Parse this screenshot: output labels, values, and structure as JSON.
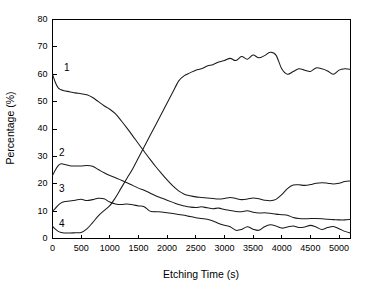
{
  "chart_data": {
    "type": "line",
    "title": "",
    "xlabel": "Etching Time (s)",
    "ylabel": "Percentage (%)",
    "xlim": [
      0,
      5200
    ],
    "ylim": [
      0,
      80
    ],
    "xticks": [
      0,
      500,
      1000,
      1500,
      2000,
      2500,
      3000,
      3500,
      4000,
      4500,
      5000
    ],
    "yticks": [
      0,
      10,
      20,
      30,
      40,
      50,
      60,
      70,
      80
    ],
    "xtick_labels": [
      "0",
      "500",
      "1000",
      "1500",
      "2000",
      "2500",
      "3000",
      "3500",
      "4000",
      "4500",
      "5000"
    ],
    "ytick_labels": [
      "0",
      "10",
      "20",
      "30",
      "40",
      "50",
      "60",
      "70",
      "80"
    ],
    "grid": false,
    "legend": "inline-curve-labels",
    "series": [
      {
        "name": "1",
        "label": "1",
        "label_x": 250,
        "label_y": 62,
        "x": [
          0,
          50,
          100,
          150,
          200,
          300,
          400,
          500,
          600,
          700,
          800,
          900,
          1000,
          1100,
          1200,
          1300,
          1400,
          1500,
          1600,
          1700,
          1800,
          1900,
          2000,
          2100,
          2200,
          2300,
          2400,
          2500,
          2600,
          2700,
          2800,
          2900,
          3000,
          3100,
          3200,
          3300,
          3400,
          3500,
          3600,
          3700,
          3800,
          3900,
          4000,
          4100,
          4200,
          4300,
          4400,
          4500,
          4600,
          4700,
          4800,
          4900,
          5000,
          5100,
          5200
        ],
        "y": [
          60.0,
          57.0,
          55.0,
          54.3,
          54.0,
          53.6,
          53.2,
          52.9,
          52.5,
          51.5,
          50.0,
          48.5,
          47.2,
          45.5,
          43.0,
          40.3,
          37.5,
          34.6,
          31.8,
          29.0,
          26.3,
          23.8,
          21.4,
          19.2,
          17.4,
          16.2,
          15.6,
          15.2,
          15.0,
          14.8,
          14.6,
          14.4,
          14.6,
          15.0,
          14.6,
          14.2,
          14.4,
          14.8,
          14.5,
          14.0,
          13.8,
          14.3,
          16.0,
          18.2,
          19.5,
          19.6,
          19.4,
          19.7,
          20.2,
          20.4,
          20.2,
          19.9,
          20.2,
          20.8,
          21.0
        ]
      },
      {
        "name": "2",
        "label": "2",
        "label_x": 160,
        "label_y": 31,
        "x": [
          0,
          50,
          100,
          150,
          200,
          300,
          400,
          500,
          600,
          700,
          800,
          900,
          1000,
          1100,
          1200,
          1300,
          1400,
          1500,
          1600,
          1700,
          1800,
          1900,
          2000,
          2100,
          2200,
          2300,
          2400,
          2500,
          2600,
          2700,
          2800,
          2900,
          3000,
          3100,
          3200,
          3300,
          3400,
          3500,
          3600,
          3700,
          3800,
          3900,
          4000,
          4100,
          4200,
          4300,
          4400,
          4500,
          4600,
          4700,
          4800,
          4900,
          5000,
          5100,
          5200
        ],
        "y": [
          23.0,
          25.0,
          26.6,
          27.3,
          27.1,
          26.6,
          26.5,
          26.5,
          26.7,
          26.4,
          25.2,
          24.0,
          23.0,
          22.2,
          21.3,
          20.4,
          19.4,
          18.4,
          17.6,
          16.6,
          15.6,
          14.8,
          14.0,
          13.2,
          12.4,
          11.9,
          11.5,
          11.3,
          11.6,
          11.2,
          10.9,
          11.1,
          10.6,
          10.2,
          9.9,
          9.8,
          10.1,
          9.6,
          9.3,
          9.4,
          9.2,
          8.9,
          8.7,
          8.5,
          7.7,
          7.3,
          7.2,
          7.3,
          7.3,
          7.2,
          7.0,
          6.9,
          6.8,
          6.8,
          7.0
        ]
      },
      {
        "name": "3",
        "label": "3",
        "label_x": 160,
        "label_y": 18,
        "x": [
          0,
          50,
          100,
          150,
          200,
          300,
          400,
          500,
          600,
          700,
          800,
          900,
          1000,
          1100,
          1200,
          1300,
          1400,
          1500,
          1600,
          1700,
          1800,
          1900,
          2000,
          2100,
          2200,
          2300,
          2400,
          2500,
          2600,
          2700,
          2800,
          2900,
          3000,
          3100,
          3200,
          3300,
          3400,
          3500,
          3600,
          3700,
          3800,
          3900,
          4000,
          4100,
          4200,
          4300,
          4400,
          4500,
          4600,
          4700,
          4800,
          4900,
          5000,
          5100,
          5200
        ],
        "y": [
          10.0,
          11.0,
          12.2,
          13.0,
          13.4,
          13.7,
          14.0,
          14.3,
          13.9,
          14.2,
          14.7,
          14.5,
          13.3,
          12.6,
          12.4,
          12.6,
          12.3,
          11.9,
          11.6,
          10.0,
          9.8,
          9.7,
          9.4,
          9.1,
          8.8,
          8.5,
          8.0,
          7.6,
          7.3,
          7.0,
          6.4,
          5.5,
          4.8,
          4.3,
          3.0,
          3.3,
          4.3,
          3.4,
          3.0,
          4.3,
          5.0,
          4.6,
          3.8,
          4.2,
          4.6,
          4.0,
          4.2,
          4.8,
          4.2,
          3.3,
          4.0,
          4.4,
          3.6,
          2.6,
          2.0
        ]
      },
      {
        "name": "4",
        "label": "4",
        "label_x": 160,
        "label_y": 5,
        "x": [
          0,
          50,
          100,
          150,
          200,
          300,
          400,
          500,
          600,
          700,
          800,
          900,
          1000,
          1100,
          1200,
          1300,
          1400,
          1500,
          1600,
          1700,
          1800,
          1900,
          2000,
          2100,
          2200,
          2300,
          2400,
          2500,
          2600,
          2700,
          2800,
          2900,
          3000,
          3100,
          3200,
          3300,
          3400,
          3500,
          3600,
          3700,
          3800,
          3900,
          4000,
          4100,
          4200,
          4300,
          4400,
          4500,
          4600,
          4700,
          4800,
          4900,
          5000,
          5100,
          5200
        ],
        "y": [
          4.5,
          3.4,
          2.6,
          2.2,
          2.0,
          2.0,
          2.1,
          2.2,
          3.5,
          5.8,
          8.3,
          10.2,
          12.0,
          15.0,
          18.5,
          22.0,
          25.5,
          29.5,
          33.5,
          37.5,
          41.5,
          45.5,
          49.5,
          53.5,
          57.5,
          59.5,
          60.5,
          61.5,
          62.0,
          63.0,
          63.5,
          64.5,
          65.0,
          65.8,
          65.0,
          66.5,
          65.5,
          67.0,
          66.0,
          66.8,
          68.0,
          67.0,
          62.0,
          60.0,
          61.0,
          62.0,
          61.5,
          61.0,
          62.3,
          62.0,
          61.2,
          60.0,
          61.5,
          62.0,
          61.8
        ]
      }
    ]
  },
  "colors": {
    "axis": "#000000",
    "line": "#1a1a1a",
    "background": "#ffffff"
  }
}
